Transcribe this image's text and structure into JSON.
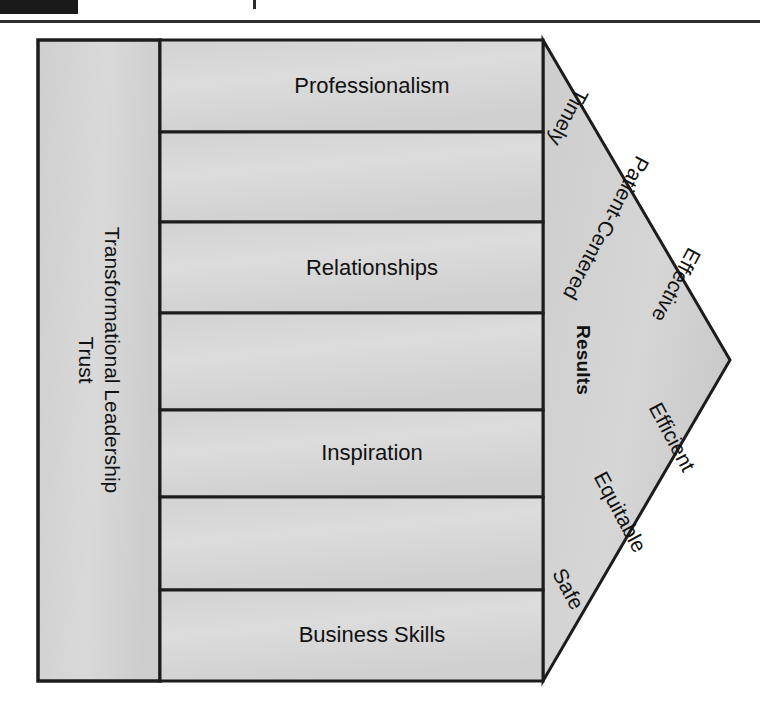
{
  "page": {
    "width": 760,
    "height": 713,
    "background": "#ffffff",
    "redaction_bar": "",
    "colors": {
      "fill_light": "#d6d6d6",
      "fill_mid": "#cfcfcf",
      "stroke": "#1c1c1c",
      "text": "#111111",
      "rule": "#2f2f2f"
    }
  },
  "diagram": {
    "type": "arrow-process-diagram",
    "left_column": {
      "line1": "Transformational",
      "line2": "Leadership",
      "line3": "Trust"
    },
    "bands": [
      {
        "index": 0,
        "label": "Professionalism",
        "y_top": 40,
        "y_bottom": 132
      },
      {
        "index": 1,
        "label": "",
        "y_top": 132,
        "y_bottom": 222
      },
      {
        "index": 2,
        "label": "Relationships",
        "y_top": 222,
        "y_bottom": 313
      },
      {
        "index": 3,
        "label": "",
        "y_top": 313,
        "y_bottom": 410
      },
      {
        "index": 4,
        "label": "Inspiration",
        "y_top": 410,
        "y_bottom": 497
      },
      {
        "index": 5,
        "label": "",
        "y_top": 497,
        "y_bottom": 590
      },
      {
        "index": 6,
        "label": "Business Skills",
        "y_top": 590,
        "y_bottom": 681
      }
    ],
    "arrow": {
      "results_label": "Results",
      "aims_upper": [
        "Timely",
        "Patient-Centered",
        "Effective"
      ],
      "aims_lower": [
        "Efficient",
        "Equitable",
        "Safe"
      ]
    }
  }
}
